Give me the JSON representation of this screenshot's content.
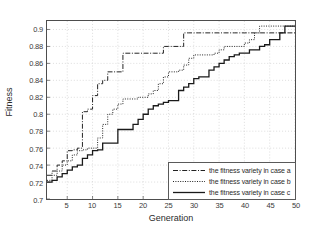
{
  "chart_data": {
    "type": "line",
    "title": "",
    "xlabel": "Generation",
    "ylabel": "Fitness",
    "xlim": [
      1,
      50
    ],
    "ylim": [
      0.7,
      0.91
    ],
    "grid": true,
    "legend_position": "lower-right",
    "xticks": [
      5,
      10,
      15,
      20,
      25,
      30,
      35,
      40,
      45,
      50
    ],
    "yticks": [
      0.7,
      0.72,
      0.74,
      0.76,
      0.78,
      0.8,
      0.82,
      0.84,
      0.86,
      0.88,
      0.9
    ],
    "xtick_labels": [
      "5",
      "10",
      "15",
      "20",
      "25",
      "30",
      "35",
      "40",
      "45",
      "50"
    ],
    "ytick_labels": [
      "0.7",
      "0.72",
      "0.74",
      "0.76",
      "0.78",
      "0.8",
      "0.82",
      "0.84",
      "0.86",
      "0.88",
      "0.9"
    ],
    "x": [
      1,
      2,
      3,
      4,
      5,
      6,
      7,
      8,
      9,
      10,
      11,
      12,
      13,
      14,
      15,
      16,
      17,
      18,
      19,
      20,
      21,
      22,
      23,
      24,
      25,
      26,
      27,
      28,
      29,
      30,
      31,
      32,
      33,
      34,
      35,
      36,
      37,
      38,
      39,
      40,
      41,
      42,
      43,
      44,
      45,
      46,
      47,
      48,
      49,
      50
    ],
    "series": [
      {
        "name": "the fitness variety in case a",
        "style": "dashdot",
        "color": "#222222",
        "values": [
          0.728,
          0.733,
          0.74,
          0.745,
          0.757,
          0.758,
          0.76,
          0.803,
          0.806,
          0.822,
          0.836,
          0.84,
          0.85,
          0.85,
          0.85,
          0.872,
          0.872,
          0.872,
          0.872,
          0.872,
          0.872,
          0.872,
          0.872,
          0.88,
          0.88,
          0.88,
          0.88,
          0.896,
          0.896,
          0.896,
          0.896,
          0.896,
          0.896,
          0.896,
          0.896,
          0.896,
          0.896,
          0.896,
          0.896,
          0.896,
          0.896,
          0.896,
          0.896,
          0.896,
          0.896,
          0.896,
          0.896,
          0.896,
          0.896,
          0.896
        ]
      },
      {
        "name": "the fitness variety in case b",
        "style": "dotted",
        "color": "#222222",
        "values": [
          0.722,
          0.728,
          0.733,
          0.74,
          0.745,
          0.752,
          0.757,
          0.758,
          0.76,
          0.76,
          0.772,
          0.788,
          0.8,
          0.806,
          0.812,
          0.818,
          0.818,
          0.818,
          0.82,
          0.82,
          0.824,
          0.828,
          0.836,
          0.844,
          0.85,
          0.85,
          0.852,
          0.858,
          0.866,
          0.87,
          0.87,
          0.87,
          0.87,
          0.872,
          0.876,
          0.88,
          0.88,
          0.88,
          0.88,
          0.884,
          0.888,
          0.896,
          0.904,
          0.904,
          0.904,
          0.904,
          0.904,
          0.904,
          0.904,
          0.904
        ]
      },
      {
        "name": "the fitness variety in case c",
        "style": "solid",
        "color": "#1a1a1a",
        "values": [
          0.72,
          0.722,
          0.726,
          0.73,
          0.734,
          0.738,
          0.74,
          0.748,
          0.752,
          0.757,
          0.758,
          0.766,
          0.766,
          0.766,
          0.782,
          0.782,
          0.782,
          0.788,
          0.794,
          0.8,
          0.806,
          0.81,
          0.812,
          0.814,
          0.816,
          0.816,
          0.828,
          0.832,
          0.836,
          0.842,
          0.844,
          0.844,
          0.852,
          0.856,
          0.86,
          0.864,
          0.868,
          0.87,
          0.872,
          0.872,
          0.876,
          0.876,
          0.88,
          0.882,
          0.888,
          0.888,
          0.896,
          0.904,
          0.904,
          0.904
        ]
      }
    ]
  },
  "axes": {
    "xlabel": "Generation",
    "ylabel": "Fitness"
  },
  "legend": {
    "items": [
      {
        "label": "the fitness variety in case a",
        "style": "dashdot"
      },
      {
        "label": "the fitness variety in case b",
        "style": "dotted"
      },
      {
        "label": "the fitness variety in case c",
        "style": "solid"
      }
    ]
  }
}
